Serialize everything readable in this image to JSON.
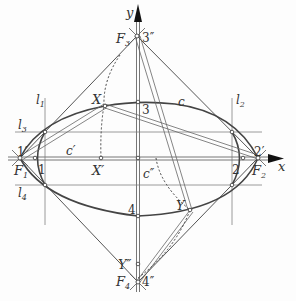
{
  "diagram": {
    "axes": {
      "x_label": "x",
      "y_label": "y"
    },
    "foci": {
      "F1": {
        "label": "F",
        "sub": "1",
        "x": 20,
        "y": 158
      },
      "F2": {
        "label": "F",
        "sub": "2",
        "x": 258,
        "y": 158
      },
      "F3": {
        "label": "F",
        "sub": "3",
        "x": 137,
        "y": 36
      },
      "F4": {
        "label": "F",
        "sub": "4",
        "x": 138,
        "y": 282
      }
    },
    "lines": {
      "l1": "l",
      "l1_sub": "1",
      "l2": "l",
      "l2_sub": "2",
      "l3": "l",
      "l3_sub": "3",
      "l4": "l",
      "l4_sub": "4"
    },
    "curves": {
      "c": "c",
      "c_prime": "c′",
      "c_double": "c″"
    },
    "points": {
      "p1": "1",
      "p2": "2",
      "p3": "3",
      "p4": "4",
      "p1p": "1′",
      "p2p": "2′",
      "p3pp": "3″",
      "p4pp": "4″",
      "X": "X",
      "Xp": "X′",
      "Y": "Y",
      "Ypp": "Y″"
    }
  }
}
